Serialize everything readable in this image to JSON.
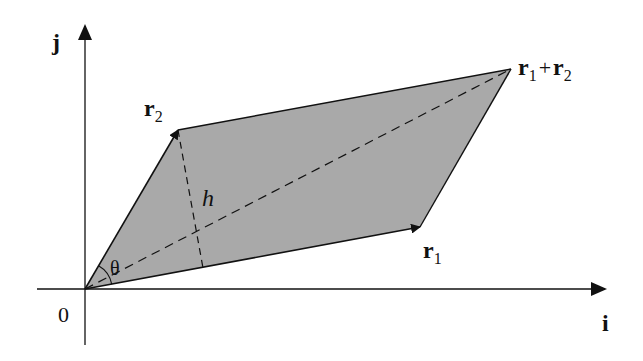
{
  "diagram": {
    "type": "vector-parallelogram",
    "colors": {
      "fill": "#a9a9a9",
      "stroke": "#111111",
      "background": "#ffffff"
    },
    "axes": {
      "x_label": "i",
      "y_label": "j",
      "origin_label": "0"
    },
    "points": {
      "origin": [
        85,
        289
      ],
      "r1_tip": [
        420,
        227
      ],
      "r2_tip": [
        178,
        130
      ],
      "sum_tip": [
        511,
        69
      ],
      "height_foot": [
        203,
        268
      ]
    },
    "labels": {
      "r1": {
        "base": "r",
        "sub": "1"
      },
      "r2": {
        "base": "r",
        "sub": "2"
      },
      "sum": {
        "a_base": "r",
        "a_sub": "1",
        "op": "+",
        "b_base": "r",
        "b_sub": "2"
      },
      "height": "h",
      "angle": "θ"
    }
  }
}
